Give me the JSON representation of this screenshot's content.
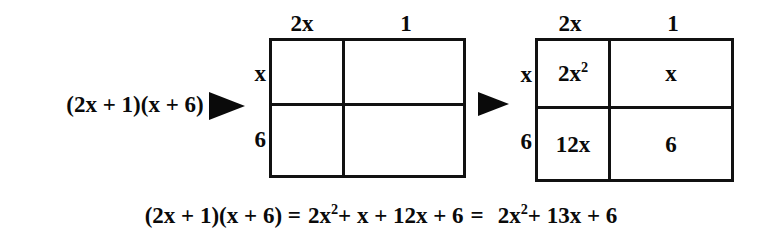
{
  "problem": {
    "expression": "(2x + 1)(x + 6)"
  },
  "arrows": [
    {
      "name": "arrow-to-blank-grid",
      "glyph": "right-triangle"
    },
    {
      "name": "arrow-to-filled-grid",
      "glyph": "right-triangle"
    }
  ],
  "grid_blank": {
    "title": "blank-area-model",
    "column_labels": [
      "2x",
      "1"
    ],
    "row_labels": [
      "x",
      "6"
    ],
    "cells": [
      {
        "base": "",
        "exp": ""
      },
      {
        "base": "",
        "exp": ""
      },
      {
        "base": "",
        "exp": ""
      },
      {
        "base": "",
        "exp": ""
      }
    ]
  },
  "grid_filled": {
    "title": "filled-area-model",
    "column_labels": [
      "2x",
      "1"
    ],
    "row_labels": [
      "x",
      "6"
    ],
    "cells": [
      {
        "base": "2x",
        "exp": "2"
      },
      {
        "base": "x",
        "exp": ""
      },
      {
        "base": "12x",
        "exp": ""
      },
      {
        "base": "6",
        "exp": ""
      }
    ]
  },
  "equation": {
    "lhs": "(2x + 1)(x + 6) =",
    "middle_base_1": "2x",
    "middle_exp_1": "2",
    "middle_rest_1": "+ x + 12x + 6",
    "equals": "=",
    "result_base": "2x",
    "result_exp": "2",
    "result_rest": "+ 13x + 6"
  },
  "colors": {
    "ink": "#0a0a0a",
    "line": "#111111",
    "background": "#ffffff"
  }
}
